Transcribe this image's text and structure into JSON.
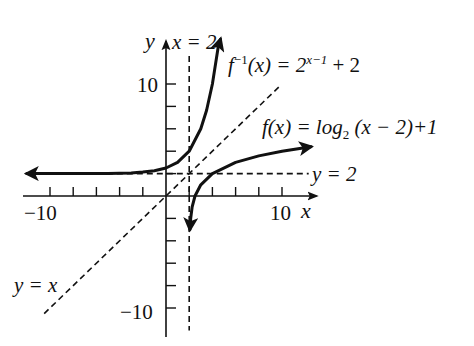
{
  "chart_data": {
    "type": "line",
    "title": "",
    "xlabel": "x",
    "ylabel": "y",
    "xlim": [
      -12.5,
      12.8
    ],
    "ylim": [
      -12.6,
      14
    ],
    "grid": false,
    "tick_step": 2,
    "x_tick_labels": [
      {
        "value": -10,
        "label": "−10"
      },
      {
        "value": 10,
        "label": "10"
      }
    ],
    "y_tick_labels": [
      {
        "value": 10,
        "label": "10"
      },
      {
        "value": -10,
        "label": "−10"
      }
    ],
    "series": [
      {
        "name": "f^-1(x) = 2^(x-1) + 2",
        "style": "solid",
        "x": [
          -12,
          -8,
          -5,
          -3,
          -2,
          -1,
          0,
          1,
          2,
          3,
          3.5,
          4,
          4.5,
          4.7
        ],
        "y": [
          2.0,
          2.0,
          2.02,
          2.06,
          2.13,
          2.25,
          2.5,
          3,
          4,
          6,
          7.66,
          10,
          13.3,
          14
        ]
      },
      {
        "name": "f(x) = log2(x - 2) + 1",
        "style": "solid",
        "x": [
          2.06,
          2.13,
          2.25,
          2.5,
          3,
          4,
          6,
          8,
          10,
          12.5
        ],
        "y": [
          -3,
          -2,
          -1,
          0,
          1,
          2,
          3,
          3.58,
          4,
          4.39
        ]
      },
      {
        "name": "y = x",
        "style": "dashed",
        "x": [
          -10.5,
          9.8
        ],
        "y": [
          -10.5,
          9.8
        ]
      },
      {
        "name": "x = 2",
        "style": "dashed",
        "x": [
          2,
          2
        ],
        "y": [
          12.5,
          -12
        ]
      },
      {
        "name": "y = 2",
        "style": "dashed",
        "x": [
          -12,
          12.3
        ],
        "y": [
          2,
          2
        ]
      }
    ],
    "annotations": [
      {
        "text": "x = 2"
      },
      {
        "text": "f^-1(x) = 2^(x-1) + 2"
      },
      {
        "text": "f(x) = log2(x-2) + 1"
      },
      {
        "text": "y = 2"
      },
      {
        "text": "y = x"
      }
    ]
  },
  "labels": {
    "y_axis": "y",
    "x_axis": "x",
    "x_eq_2": "x = 2",
    "y_eq_2": "y = 2",
    "y_eq_x": "y = x",
    "finv_f": "f",
    "finv_sup": "−1",
    "finv_mid": "(x) = 2",
    "finv_exp": "x−1",
    "finv_tail": " + 2",
    "f_name": "f",
    "f_mid": "(x) = log",
    "f_sub": "2",
    "f_tail": " (x − 2)+1",
    "tick_y10": "10",
    "tick_yneg10": "−10",
    "tick_xneg10": "−10",
    "tick_x10": "10"
  }
}
